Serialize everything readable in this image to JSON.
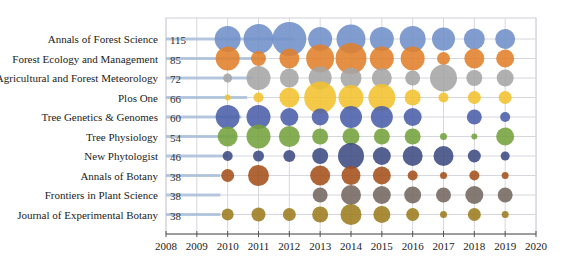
{
  "chart_data": {
    "type": "bubble",
    "title": "",
    "xlabel": "",
    "ylabel": "",
    "xlim": [
      2008,
      2020
    ],
    "x_ticks": [
      "2008",
      "2009",
      "2010",
      "2011",
      "2012",
      "2013",
      "2014",
      "2015",
      "2016",
      "2017",
      "2018",
      "2019",
      "2020"
    ],
    "grid": true,
    "years": [
      2010,
      2011,
      2012,
      2013,
      2014,
      2015,
      2016,
      2017,
      2018,
      2019
    ],
    "series": [
      {
        "name": "Annals of Forest Science",
        "total": 115,
        "color": "#6f8fc8",
        "sizes": [
          26,
          30,
          34,
          24,
          29,
          24,
          26,
          23,
          21,
          20
        ]
      },
      {
        "name": "Forest Ecology and Management",
        "total": 85,
        "color": "#e07f2a",
        "sizes": [
          24,
          15,
          20,
          28,
          31,
          24,
          24,
          13,
          20,
          18
        ]
      },
      {
        "name": "Agricultural and Forest Meteorology",
        "total": 72,
        "color": "#a5a5a5",
        "sizes": [
          9,
          24,
          19,
          23,
          21,
          20,
          15,
          27,
          16,
          17
        ]
      },
      {
        "name": "Plos One",
        "total": 66,
        "color": "#f2c12e",
        "sizes": [
          6,
          10,
          20,
          32,
          25,
          27,
          16,
          10,
          13,
          13
        ]
      },
      {
        "name": "Tree Genetics & Genomes",
        "total": 60,
        "color": "#4a5fa8",
        "sizes": [
          24,
          24,
          18,
          17,
          22,
          22,
          18,
          0,
          15,
          10
        ]
      },
      {
        "name": "Tree Physiology",
        "total": 54,
        "color": "#74a23c",
        "sizes": [
          20,
          24,
          21,
          16,
          17,
          16,
          16,
          7,
          6,
          18
        ]
      },
      {
        "name": "New Phytologist",
        "total": 46,
        "color": "#3c4b82",
        "sizes": [
          10,
          11,
          12,
          16,
          26,
          18,
          20,
          20,
          13,
          9
        ]
      },
      {
        "name": "Annals of Botany",
        "total": 38,
        "color": "#a5501a",
        "sizes": [
          13,
          21,
          0,
          20,
          19,
          18,
          10,
          7,
          10,
          7
        ]
      },
      {
        "name": "Frontiers in Plant Science",
        "total": 38,
        "color": "#736860",
        "sizes": [
          0,
          0,
          0,
          15,
          20,
          18,
          17,
          15,
          18,
          15
        ]
      },
      {
        "name": "Journal of Experimental Botany",
        "total": 38,
        "color": "#9c7c1e",
        "sizes": [
          12,
          14,
          13,
          16,
          21,
          17,
          13,
          7,
          13,
          7
        ]
      }
    ]
  }
}
